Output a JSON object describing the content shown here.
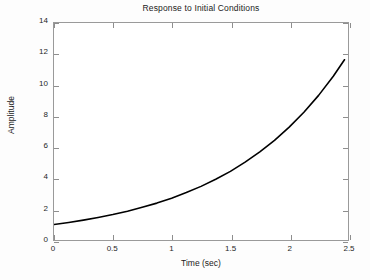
{
  "chart_data": {
    "type": "line",
    "title": "Response to Initial Conditions",
    "xlabel": "Time (sec)",
    "ylabel": "Amplitude",
    "xlim": [
      0,
      2.5
    ],
    "ylim": [
      0,
      14
    ],
    "xticks": [
      "0",
      "0.5",
      "1",
      "1.5",
      "2",
      "2.5"
    ],
    "xtick_values": [
      0,
      0.5,
      1,
      1.5,
      2,
      2.5
    ],
    "yticks": [
      "0",
      "2",
      "4",
      "6",
      "8",
      "10",
      "12",
      "14"
    ],
    "ytick_values": [
      0,
      2,
      4,
      6,
      8,
      10,
      12,
      14
    ],
    "grid": false,
    "legend": null,
    "line_color": "#000000",
    "line_width": 1.6,
    "series": [
      {
        "name": "initial condition response",
        "x": [
          0,
          0.125,
          0.25,
          0.375,
          0.5,
          0.625,
          0.75,
          0.875,
          1,
          1.125,
          1.25,
          1.375,
          1.5,
          1.625,
          1.75,
          1.875,
          2,
          2.125,
          2.25,
          2.375,
          2.47
        ],
        "y": [
          1,
          1.13,
          1.28,
          1.45,
          1.64,
          1.86,
          2.11,
          2.38,
          2.7,
          3.06,
          3.46,
          3.92,
          4.43,
          5.02,
          5.68,
          6.43,
          7.28,
          8.24,
          9.33,
          10.56,
          11.63
        ]
      }
    ]
  },
  "axes": {
    "title": "Response to Initial Conditions",
    "x_title": "Time (sec)",
    "y_title": "Amplitude"
  }
}
